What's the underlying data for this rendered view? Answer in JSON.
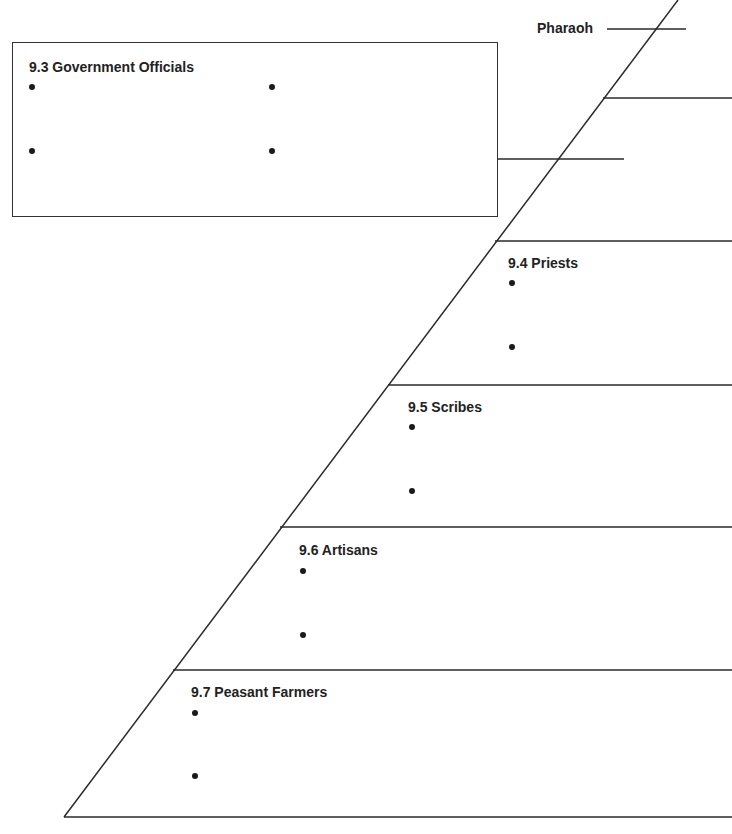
{
  "diagram": {
    "type": "social-pyramid-notes",
    "pharaoh": {
      "label": "Pharaoh"
    },
    "government_officials": {
      "label": "9.3 Government Officials",
      "bullets": 4
    },
    "levels": [
      {
        "label": "9.4 Priests",
        "bullets": 2
      },
      {
        "label": "9.5 Scribes",
        "bullets": 2
      },
      {
        "label": "9.6 Artisans",
        "bullets": 2
      },
      {
        "label": "9.7 Peasant Farmers",
        "bullets": 2
      }
    ]
  },
  "colors": {
    "line": "#2a2a2a",
    "text": "#222222",
    "background": "#ffffff"
  }
}
